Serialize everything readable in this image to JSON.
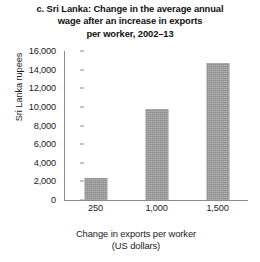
{
  "chart_data": {
    "type": "bar",
    "title": "c. Sri Lanka: Change in the average annual wage after an increase in exports per worker, 2002–13",
    "title_lines": [
      "c. Sri Lanka: Change in the average annual",
      "wage after an increase in exports",
      "per worker, 2002–13"
    ],
    "categories": [
      "250",
      "1,000",
      "1,500"
    ],
    "values": [
      2400,
      9800,
      14700
    ],
    "xlabel": "Change in exports per worker (US dollars)",
    "xlabel_lines": [
      "Change in exports per worker",
      "(US dollars)"
    ],
    "ylabel": "Sri Lanka rupees",
    "ylim": [
      0,
      16000
    ],
    "ytick_step": 2000,
    "ytick_labels": [
      "16,000",
      "14,000",
      "12,000",
      "10,000",
      "8,000",
      "6,000",
      "4,000",
      "2,000",
      "0"
    ],
    "ytick_values": [
      16000,
      14000,
      12000,
      10000,
      8000,
      6000,
      4000,
      2000,
      0
    ],
    "grid": false,
    "legend": false,
    "bar_color": "#9a9a9a",
    "axis_color": "#8c8c8c",
    "background_color": "#ffffff"
  }
}
